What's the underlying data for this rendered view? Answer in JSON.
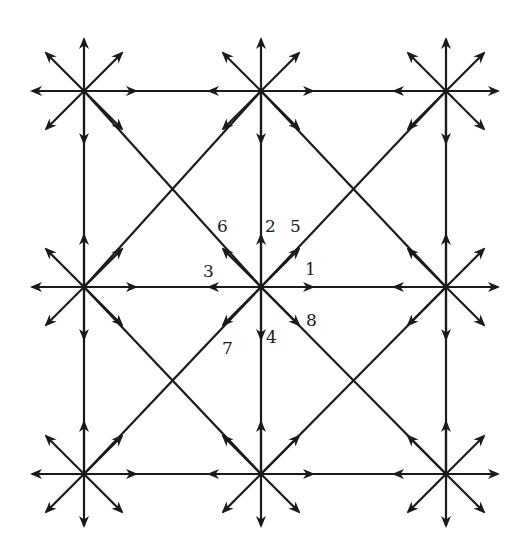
{
  "diagram": {
    "type": "lattice-velocity-directions",
    "stroke_color": "#1a1a1a",
    "background": "#ffffff",
    "nodes": {
      "columns_x": [
        84,
        261,
        446
      ],
      "rows_y": [
        91,
        287,
        474
      ]
    },
    "center_labels": [
      {
        "id": "1",
        "text": "1",
        "direction": "east",
        "x": 305,
        "y": 261
      },
      {
        "id": "2",
        "text": "2",
        "direction": "north",
        "x": 265,
        "y": 218
      },
      {
        "id": "3",
        "text": "3",
        "direction": "west",
        "x": 203,
        "y": 263
      },
      {
        "id": "4",
        "text": "4",
        "direction": "south",
        "x": 266,
        "y": 329
      },
      {
        "id": "5",
        "text": "5",
        "direction": "north-east",
        "x": 290,
        "y": 218
      },
      {
        "id": "6",
        "text": "6",
        "direction": "north-west",
        "x": 217,
        "y": 218
      },
      {
        "id": "7",
        "text": "7",
        "direction": "south-west",
        "x": 222,
        "y": 340
      },
      {
        "id": "8",
        "text": "8",
        "direction": "south-east",
        "x": 306,
        "y": 312
      }
    ]
  }
}
